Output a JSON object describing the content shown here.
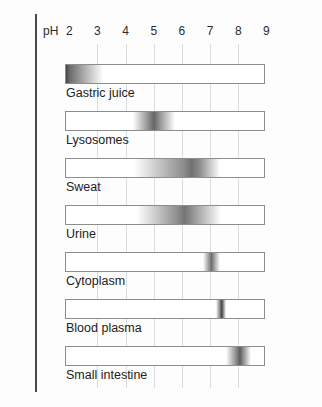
{
  "figure": {
    "axis_caption": "pH",
    "tick_labels": [
      "2",
      "3",
      "4",
      "5",
      "6",
      "7",
      "8",
      "9"
    ],
    "axis_min": 1.85,
    "axis_max": 8.95,
    "grid_color": "#d9dde2",
    "band_color": "#3a3a3a",
    "rule_color": "#4a4a4a"
  },
  "chart_data": {
    "type": "bar",
    "xlabel": "pH",
    "ylabel": "",
    "xlim": [
      1.85,
      8.95
    ],
    "xticks": [
      2,
      3,
      4,
      5,
      6,
      7,
      8,
      9
    ],
    "grid": true,
    "legend": "none",
    "categories": [
      "Gastric juice",
      "Lysosomes",
      "Sweat",
      "Urine",
      "Cytoplasm",
      "Blood plasma",
      "Small intestine"
    ],
    "series": [
      {
        "name": "pH range (density band)",
        "ranges": [
          {
            "label": "Gastric juice",
            "start": 1.85,
            "end": 3.2,
            "peak": 1.9,
            "intensity": 0.92
          },
          {
            "label": "Lysosomes",
            "start": 4.25,
            "end": 5.75,
            "peak": 5.0,
            "intensity": 0.78
          },
          {
            "label": "Sweat",
            "start": 4.3,
            "end": 7.35,
            "peak": 6.35,
            "intensity": 0.72
          },
          {
            "label": "Urine",
            "start": 4.4,
            "end": 7.4,
            "peak": 6.1,
            "intensity": 0.7
          },
          {
            "label": "Cytoplasm",
            "start": 6.75,
            "end": 7.35,
            "peak": 7.05,
            "intensity": 0.74
          },
          {
            "label": "Blood plasma",
            "start": 7.2,
            "end": 7.55,
            "peak": 7.4,
            "intensity": 0.95
          },
          {
            "label": "Small intestine",
            "start": 7.55,
            "end": 8.45,
            "peak": 8.05,
            "intensity": 0.82
          }
        ]
      }
    ]
  },
  "rows": [
    {
      "label": "Gastric juice"
    },
    {
      "label": "Lysosomes"
    },
    {
      "label": "Sweat"
    },
    {
      "label": "Urine"
    },
    {
      "label": "Cytoplasm"
    },
    {
      "label": "Blood plasma"
    },
    {
      "label": "Small intestine"
    }
  ]
}
